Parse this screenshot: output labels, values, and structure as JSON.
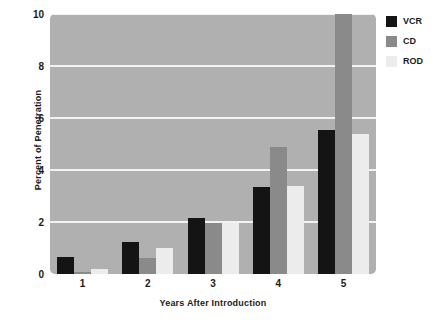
{
  "chart_data": {
    "type": "bar",
    "title": "",
    "xlabel": "Years After Introduction",
    "ylabel": "Percent of Penetration",
    "categories": [
      "1",
      "2",
      "3",
      "4",
      "5"
    ],
    "series": [
      {
        "name": "VCR",
        "color": "#141414",
        "values": [
          0.65,
          1.25,
          2.15,
          3.35,
          5.55
        ]
      },
      {
        "name": "CD",
        "color": "#8a8a8a",
        "values": [
          0.08,
          0.6,
          1.95,
          4.9,
          10.0
        ]
      },
      {
        "name": "ROD",
        "color": "#ececec",
        "values": [
          0.2,
          1.0,
          1.95,
          3.4,
          5.4
        ]
      }
    ],
    "ylim": [
      0,
      10
    ],
    "yticks": [
      0,
      2,
      4,
      6,
      8,
      10
    ],
    "ytick_labels": [
      "0",
      "2",
      "4",
      "6",
      "8",
      "10"
    ],
    "grid": true,
    "legend_position": "top-right",
    "plot_background": "#b0b0b0",
    "gridline_color": "#f2f2f2"
  }
}
